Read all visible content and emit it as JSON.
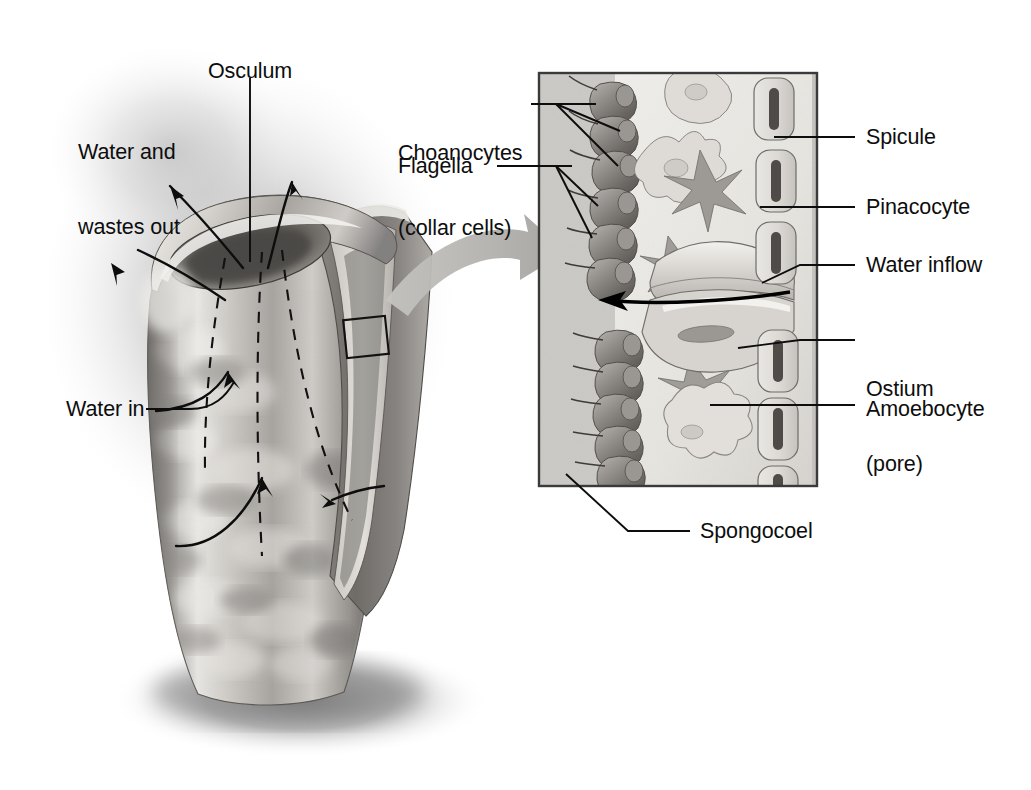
{
  "figure": {
    "type": "labeled-biological-diagram",
    "background_color": "#ffffff",
    "ink_color": "#0d0d0d"
  },
  "labels": {
    "osculum": "Osculum",
    "water_wastes_out": "Water and\nwastes out",
    "water_in": "Water in",
    "choanocytes": "Choanocytes\n(collar cells)",
    "flagella": "Flagella",
    "spicule": "Spicule",
    "pinacocyte": "Pinacocyte",
    "water_inflow": "Water inflow",
    "ostium": "Ostium\n(pore)",
    "amoebocyte": "Amoebocyte",
    "spongocoel": "Spongocoel"
  },
  "label_lines": {
    "osculum_l1": "Osculum",
    "water_out_l1": "Water and",
    "water_out_l2": "wastes out",
    "water_in_l1": "Water in",
    "choanocytes_l1": "Choanocytes",
    "choanocytes_l2": "(collar cells)",
    "flagella_l1": "Flagella",
    "spicule_l1": "Spicule",
    "pinacocyte_l1": "Pinacocyte",
    "water_inflow_l1": "Water inflow",
    "ostium_l1": "Ostium",
    "ostium_l2": "(pore)",
    "amoebocyte_l1": "Amoebocyte",
    "spongocoel_l1": "Spongocoel"
  },
  "colors": {
    "sponge_body_light": "#e6e4e2",
    "sponge_body_mid": "#b6b3af",
    "sponge_body_dark": "#6f6c69",
    "halo_shadow": "#b9b9b9",
    "ground_shadow": "#8d8d8d",
    "inset_background": "#cfcdc9",
    "inset_interior": "#eceae6",
    "inset_border": "#3a3a3a",
    "choanocyte_fill": "#8f8b86",
    "choanocyte_dark": "#5e5a56",
    "spicule_fill": "#f4f2ee",
    "spicule_core": "#4a4744",
    "pinacocyte_fill": "#dcd9d4",
    "amoebocyte_fill": "#e4e1dc",
    "callout_arrow": "#b4b2ae",
    "leader_line": "#0d0d0d"
  },
  "inset_panel": {
    "x": 538,
    "y": 72,
    "width": 280,
    "height": 415,
    "description": "Magnified cross-section of sponge body wall"
  },
  "callout_box": {
    "x": 345,
    "y": 318,
    "width": 42,
    "height": 38,
    "description": "Small rectangle on sponge wall indicating magnified region"
  },
  "flow_arrows": {
    "water_out_count": 3,
    "water_in_count": 3,
    "inset_inflow_count": 1,
    "dashed_guide_count": 3
  }
}
